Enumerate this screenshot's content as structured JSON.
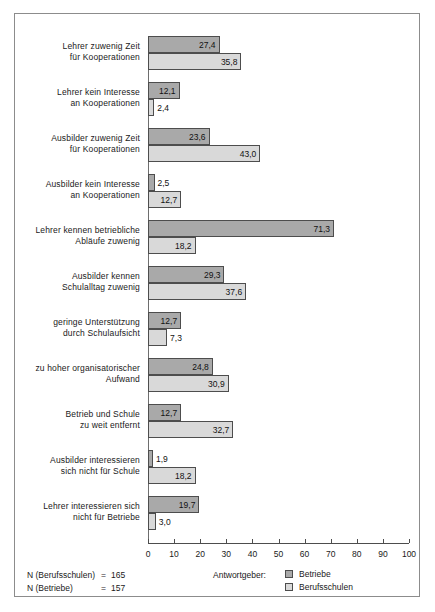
{
  "chart_data": {
    "type": "bar",
    "orientation": "horizontal",
    "title": "",
    "xlabel": "",
    "ylabel": "",
    "xlim": [
      0,
      100
    ],
    "xticks": [
      0,
      10,
      20,
      30,
      40,
      50,
      60,
      70,
      80,
      90,
      100
    ],
    "xtick_labels": [
      "0",
      "10",
      "20",
      "30",
      "40",
      "50",
      "60",
      "70",
      "80",
      "90",
      "100"
    ],
    "grid": false,
    "decimal_separator": ",",
    "categories": [
      "Lehrer zuwenig Zeit\nfür Kooperationen",
      "Lehrer kein Interesse\nan Kooperationen",
      "Ausbilder zuwenig Zeit\nfür Kooperationen",
      "Ausbilder kein Interesse\nan Kooperationen",
      "Lehrer kennen betriebliche\nAbläufe zuwenig",
      "Ausbilder kennen\nSchulalltag zuwenig",
      "geringe Unterstützung\ndurch Schulaufsicht",
      "zu hoher organisatorischer\nAufwand",
      "Betrieb und Schule\nzu weit entfernt",
      "Ausbilder interessieren\nsich nicht für Schule",
      "Lehrer interessieren sich\nnicht für Betriebe"
    ],
    "series": [
      {
        "name": "Betriebe",
        "color": "#a9a9a9",
        "values": [
          27.4,
          12.1,
          23.6,
          2.5,
          71.3,
          29.3,
          12.7,
          24.8,
          12.7,
          1.9,
          19.7
        ],
        "labels": [
          "27,4",
          "12,1",
          "23,6",
          "2,5",
          "71,3",
          "29,3",
          "12,7",
          "24,8",
          "12,7",
          "1,9",
          "19,7"
        ]
      },
      {
        "name": "Berufsschulen",
        "color": "#d9d9d9",
        "values": [
          35.8,
          2.4,
          43.0,
          12.7,
          18.2,
          37.6,
          7.3,
          30.9,
          32.7,
          18.2,
          3.0
        ],
        "labels": [
          "35,8",
          "2,4",
          "43,0",
          "12,7",
          "18,2",
          "37,6",
          "7,3",
          "30,9",
          "32,7",
          "18,2",
          "3,0"
        ]
      }
    ]
  },
  "legend": {
    "title": "Antwortgeber:",
    "position": "bottom-right",
    "entries": [
      {
        "label": "Betriebe",
        "color": "#a9a9a9"
      },
      {
        "label": "Berufsschulen",
        "color": "#d9d9d9"
      }
    ]
  },
  "notes": [
    {
      "label": "N (Berufsschulen)",
      "eq": "=",
      "value": "165"
    },
    {
      "label": "N (Betriebe)",
      "eq": "=",
      "value": "157"
    }
  ]
}
